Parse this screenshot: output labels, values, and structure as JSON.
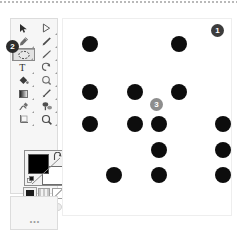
{
  "app": {
    "name": "GIMP Toolbox",
    "background_color": "#ffffff",
    "canvas_color": "#ffffff",
    "dot_color": "#0d0d0d"
  },
  "toolbox": {
    "panel_background": "#f6f6f6",
    "panel_border": "#dcdcdc",
    "selected_tool_index": 4,
    "tools": [
      {
        "index": 0,
        "icon": "move-tool-icon",
        "label": "Move",
        "has_submenu": false,
        "selected": false
      },
      {
        "index": 1,
        "icon": "path-select-tool-icon",
        "label": "Paths",
        "has_submenu": true,
        "selected": false
      },
      {
        "index": 2,
        "icon": "free-select-tool-icon",
        "label": "Free Select",
        "has_submenu": true,
        "selected": false
      },
      {
        "index": 3,
        "icon": "ink-pen-tool-icon",
        "label": "Ink",
        "has_submenu": true,
        "selected": false
      },
      {
        "index": 4,
        "icon": "ellipse-select-tool-icon",
        "label": "Ellipse Select",
        "has_submenu": true,
        "selected": true
      },
      {
        "index": 5,
        "icon": "paintbrush-tool-icon",
        "label": "Paintbrush",
        "has_submenu": true,
        "selected": false
      },
      {
        "index": 6,
        "icon": "text-tool-icon",
        "label": "Text",
        "has_submenu": true,
        "selected": false
      },
      {
        "index": 7,
        "icon": "rotate-tool-icon",
        "label": "Rotate",
        "has_submenu": true,
        "selected": false
      },
      {
        "index": 8,
        "icon": "bucket-fill-tool-icon",
        "label": "Bucket Fill",
        "has_submenu": true,
        "selected": false
      },
      {
        "index": 9,
        "icon": "color-picker-tool-icon",
        "label": "Color Picker",
        "has_submenu": true,
        "selected": false
      },
      {
        "index": 10,
        "icon": "gradient-tool-icon",
        "label": "Gradient",
        "has_submenu": true,
        "selected": false
      },
      {
        "index": 11,
        "icon": "pencil-tool-icon",
        "label": "Pencil",
        "has_submenu": true,
        "selected": false
      },
      {
        "index": 12,
        "icon": "smudge-tool-icon",
        "label": "Smudge",
        "has_submenu": true,
        "selected": false
      },
      {
        "index": 13,
        "icon": "clone-tool-icon",
        "label": "Clone",
        "has_submenu": true,
        "selected": false
      },
      {
        "index": 14,
        "icon": "crop-tool-icon",
        "label": "Crop",
        "has_submenu": true,
        "selected": false
      },
      {
        "index": 15,
        "icon": "zoom-tool-icon",
        "label": "Zoom",
        "has_submenu": true,
        "selected": false
      }
    ],
    "colors": {
      "foreground": "#000000",
      "background": "#ffffff",
      "foreground_label": "Foreground color",
      "background_label": "Background color",
      "swap_label": "Swap colors",
      "reset_label": "Reset colors"
    },
    "swatches": [
      {
        "icon": "brush-swatch-icon",
        "label": "Active brush"
      },
      {
        "icon": "pattern-swatch-icon",
        "label": "Active pattern"
      },
      {
        "icon": "gradient-swatch-icon",
        "label": "Active gradient"
      }
    ],
    "mini_items": [
      {
        "icon": "image-thumbnail-icon",
        "label": "Active image"
      },
      {
        "icon": "dialog-dot-icon",
        "label": "Dialog"
      },
      {
        "icon": "dialog-dot-icon-2",
        "label": "Dialog"
      }
    ],
    "footer": {
      "icon": "documents-icon",
      "icon_label": "Open images",
      "ellipsis": "•••"
    }
  },
  "canvas": {
    "label": "Image canvas",
    "width": 170,
    "height": 198,
    "dot_radius": 8,
    "dots": [
      {
        "cx": 27,
        "cy": 25
      },
      {
        "cx": 116,
        "cy": 25
      },
      {
        "cx": 27,
        "cy": 73
      },
      {
        "cx": 72,
        "cy": 73
      },
      {
        "cx": 116,
        "cy": 73
      },
      {
        "cx": 27,
        "cy": 105
      },
      {
        "cx": 72,
        "cy": 105
      },
      {
        "cx": 96,
        "cy": 105
      },
      {
        "cx": 160,
        "cy": 105
      },
      {
        "cx": 96,
        "cy": 131
      },
      {
        "cx": 160,
        "cy": 131
      },
      {
        "cx": 51,
        "cy": 156
      },
      {
        "cx": 96,
        "cy": 156
      },
      {
        "cx": 160,
        "cy": 156
      }
    ]
  },
  "annotations": [
    {
      "id": "1",
      "number": "1",
      "color": "#3c3c3c",
      "target": "canvas-top-right"
    },
    {
      "id": "2",
      "number": "2",
      "color": "#2b2b2b",
      "target": "selected-tool"
    },
    {
      "id": "3",
      "number": "3",
      "color": "#8d8d8d",
      "target": "canvas-middle"
    }
  ]
}
